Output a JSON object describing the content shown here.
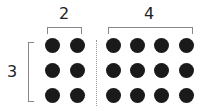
{
  "labels": {
    "left_cols": "2",
    "right_cols": "4",
    "rows": "3"
  },
  "grid": {
    "rows": 3,
    "left_columns": 2,
    "right_columns": 4,
    "dot_color": "#1a1a1a"
  }
}
